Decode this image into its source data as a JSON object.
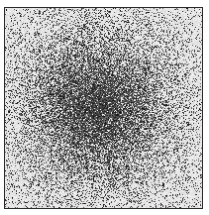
{
  "figure": {
    "background_color": "#f4f4f4",
    "ink_color": "#111111",
    "frame_color": "#2a2a2a",
    "blob": {
      "center_x_frac": 0.47,
      "center_y_frac": 0.5,
      "sigma_x_frac": 0.24,
      "sigma_y_frac": 0.25,
      "peak_density": 0.92,
      "base_density": 0.1
    },
    "seed": 1337
  }
}
